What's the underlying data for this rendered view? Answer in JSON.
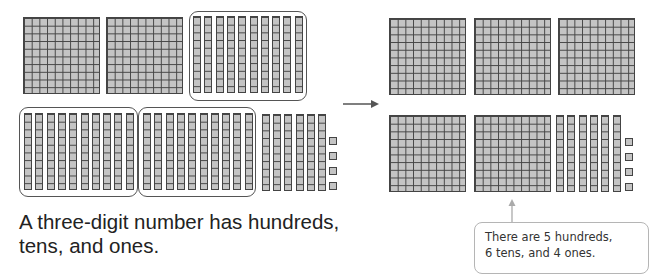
{
  "caption": {
    "line1": "A three-digit number has hundreds,",
    "line2": "tens, and ones."
  },
  "callout": {
    "line1": "There are 5 hundreds,",
    "line2": "6 tens, and 4 ones."
  },
  "left_model": {
    "hundreds_flats": 2,
    "grouped_tens": [
      10,
      10,
      10
    ],
    "loose_tens": 6,
    "ones": 4
  },
  "right_model": {
    "hundreds_flats": 5,
    "tens": 6,
    "ones": 4
  },
  "colors": {
    "block_fill": "#c4c4c4",
    "block_line": "#444444",
    "group_border": "#555555",
    "callout_border": "#b5b5b5"
  }
}
